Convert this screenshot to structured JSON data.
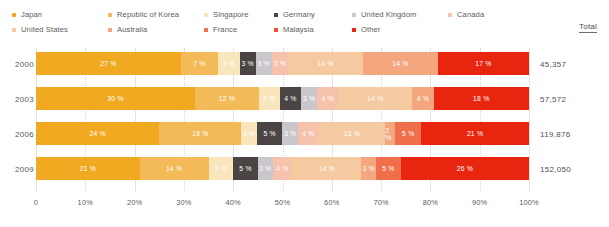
{
  "legend": {
    "rows": [
      [
        {
          "label": "Japan",
          "color": "#f2a922"
        },
        {
          "label": "Republic of Korea",
          "color": "#f3ba57"
        },
        {
          "label": "Singapore",
          "color": "#fae6bd"
        },
        {
          "label": "Germany",
          "color": "#4b4445"
        },
        {
          "label": "United Kingdom",
          "color": "#c9c7cb"
        },
        {
          "label": "Canada",
          "color": "#f6c2ac"
        }
      ],
      [
        {
          "label": "United States",
          "color": "#f5caa0"
        },
        {
          "label": "Australia",
          "color": "#f4a77f"
        },
        {
          "label": "France",
          "color": "#ef6f4a"
        },
        {
          "label": "Malaysia",
          "color": "#ef4f2e"
        },
        {
          "label": "Other",
          "color": "#e8260f"
        }
      ]
    ]
  },
  "total_header": "Total",
  "chart_data": {
    "type": "bar",
    "subtype": "stacked-horizontal-100pct",
    "title": "",
    "xlabel": "",
    "ylabel": "",
    "xlim": [
      0,
      100
    ],
    "grid": true,
    "legend_position": "top",
    "categories": [
      "2000",
      "2003",
      "2006",
      "2009"
    ],
    "totals": [
      "45,357",
      "57,572",
      "119,876",
      "152,050"
    ],
    "tick_labels": [
      "0",
      "10%",
      "20%",
      "30%",
      "40%",
      "50%",
      "60%",
      "70%",
      "80%",
      "90%",
      "100%"
    ],
    "tick_values": [
      0,
      10,
      20,
      30,
      40,
      50,
      60,
      70,
      80,
      90,
      100
    ],
    "series": [
      {
        "name": "Japan",
        "color": "#f2a922",
        "values": [
          27,
          30,
          24,
          21
        ]
      },
      {
        "name": "Republic of Korea",
        "color": "#f3ba57",
        "values": [
          7,
          12,
          16,
          14
        ]
      },
      {
        "name": "Singapore",
        "color": "#fae6bd",
        "values": [
          4,
          4,
          3,
          5
        ]
      },
      {
        "name": "Germany",
        "color": "#4b4445",
        "values": [
          3,
          4,
          5,
          5
        ]
      },
      {
        "name": "United Kingdom",
        "color": "#c9c7cb",
        "values": [
          3,
          3,
          3,
          3
        ]
      },
      {
        "name": "Canada",
        "color": "#f6c2ac",
        "values": [
          3,
          4,
          4,
          4
        ]
      },
      {
        "name": "United States",
        "color": "#f5caa0",
        "values": [
          14,
          14,
          13,
          14
        ]
      },
      {
        "name": "Australia",
        "color": "#f4a77f",
        "values": [
          14,
          4,
          2,
          3
        ]
      },
      {
        "name": "France",
        "color": "#ef6f4a",
        "values": [
          0,
          0,
          5,
          5
        ]
      },
      {
        "name": "Other",
        "color": "#e8260f",
        "values": [
          17,
          18,
          21,
          26
        ]
      }
    ],
    "rows": [
      {
        "category": "2000",
        "total": "45,357",
        "segments": [
          {
            "series": "Japan",
            "value": 27,
            "label": "27 %",
            "color": "#f2a922",
            "show_label": true
          },
          {
            "series": "Republic of Korea",
            "value": 7,
            "label": "7 %",
            "color": "#f3ba57",
            "show_label": true
          },
          {
            "series": "Singapore",
            "value": 4,
            "label": "4 %",
            "color": "#fae6bd",
            "show_label": true
          },
          {
            "series": "Germany",
            "value": 3,
            "label": "3 %",
            "color": "#4b4445",
            "show_label": true
          },
          {
            "series": "United Kingdom",
            "value": 3,
            "label": "3 %",
            "color": "#c9c7cb",
            "show_label": true
          },
          {
            "series": "Canada",
            "value": 3,
            "label": "3 %",
            "color": "#f6c2ac",
            "show_label": true
          },
          {
            "series": "United States",
            "value": 14,
            "label": "14 %",
            "color": "#f5caa0",
            "show_label": true
          },
          {
            "series": "Australia",
            "value": 14,
            "label": "14 %",
            "color": "#f4a77f",
            "show_label": true
          },
          {
            "series": "Other",
            "value": 17,
            "label": "17 %",
            "color": "#e8260f",
            "show_label": true
          }
        ]
      },
      {
        "category": "2003",
        "total": "57,572",
        "segments": [
          {
            "series": "Japan",
            "value": 30,
            "label": "30 %",
            "color": "#f2a922",
            "show_label": true
          },
          {
            "series": "Republic of Korea",
            "value": 12,
            "label": "12 %",
            "color": "#f3ba57",
            "show_label": true
          },
          {
            "series": "Singapore",
            "value": 4,
            "label": "4 %",
            "color": "#fae6bd",
            "show_label": true
          },
          {
            "series": "Germany",
            "value": 4,
            "label": "4 %",
            "color": "#4b4445",
            "show_label": true
          },
          {
            "series": "United Kingdom",
            "value": 3,
            "label": "3 %",
            "color": "#c9c7cb",
            "show_label": true
          },
          {
            "series": "Canada",
            "value": 4,
            "label": "4 %",
            "color": "#f6c2ac",
            "show_label": true
          },
          {
            "series": "United States",
            "value": 14,
            "label": "14 %",
            "color": "#f5caa0",
            "show_label": true
          },
          {
            "series": "Australia",
            "value": 4,
            "label": "4 %",
            "color": "#f4a77f",
            "show_label": true
          },
          {
            "series": "Other",
            "value": 18,
            "label": "18 %",
            "color": "#e8260f",
            "show_label": true
          }
        ]
      },
      {
        "category": "2006",
        "total": "119,876",
        "segments": [
          {
            "series": "Japan",
            "value": 24,
            "label": "24 %",
            "color": "#f2a922",
            "show_label": true
          },
          {
            "series": "Republic of Korea",
            "value": 16,
            "label": "16 %",
            "color": "#f3ba57",
            "show_label": true
          },
          {
            "series": "Singapore",
            "value": 3,
            "label": "3 %",
            "color": "#fae6bd",
            "show_label": true
          },
          {
            "series": "Germany",
            "value": 5,
            "label": "5 %",
            "color": "#4b4445",
            "show_label": true
          },
          {
            "series": "United Kingdom",
            "value": 3,
            "label": "3 %",
            "color": "#c9c7cb",
            "show_label": true
          },
          {
            "series": "Canada",
            "value": 4,
            "label": "4 %",
            "color": "#f6c2ac",
            "show_label": true
          },
          {
            "series": "United States",
            "value": 13,
            "label": "13 %",
            "color": "#f5caa0",
            "show_label": true
          },
          {
            "series": "Australia",
            "value": 2,
            "label": "2 %",
            "color": "#f4a77f",
            "show_label": true
          },
          {
            "series": "France",
            "value": 5,
            "label": "5 %",
            "color": "#ef6f4a",
            "show_label": true
          },
          {
            "series": "Other",
            "value": 21,
            "label": "21 %",
            "color": "#e8260f",
            "show_label": true
          }
        ]
      },
      {
        "category": "2009",
        "total": "152,050",
        "segments": [
          {
            "series": "Japan",
            "value": 21,
            "label": "21 %",
            "color": "#f2a922",
            "show_label": true
          },
          {
            "series": "Republic of Korea",
            "value": 14,
            "label": "14 %",
            "color": "#f3ba57",
            "show_label": true
          },
          {
            "series": "Singapore",
            "value": 5,
            "label": "5 %",
            "color": "#fae6bd",
            "show_label": true
          },
          {
            "series": "Germany",
            "value": 5,
            "label": "5 %",
            "color": "#4b4445",
            "show_label": true
          },
          {
            "series": "United Kingdom",
            "value": 3,
            "label": "3 %",
            "color": "#c9c7cb",
            "show_label": true
          },
          {
            "series": "Canada",
            "value": 4,
            "label": "4 %",
            "color": "#f6c2ac",
            "show_label": true
          },
          {
            "series": "United States",
            "value": 14,
            "label": "14 %",
            "color": "#f5caa0",
            "show_label": true
          },
          {
            "series": "Australia",
            "value": 3,
            "label": "3 %",
            "color": "#f4a77f",
            "show_label": true
          },
          {
            "series": "France",
            "value": 5,
            "label": "5 %",
            "color": "#ef6f4a",
            "show_label": true
          },
          {
            "series": "Other",
            "value": 26,
            "label": "26 %",
            "color": "#e8260f",
            "show_label": true
          }
        ]
      }
    ]
  }
}
